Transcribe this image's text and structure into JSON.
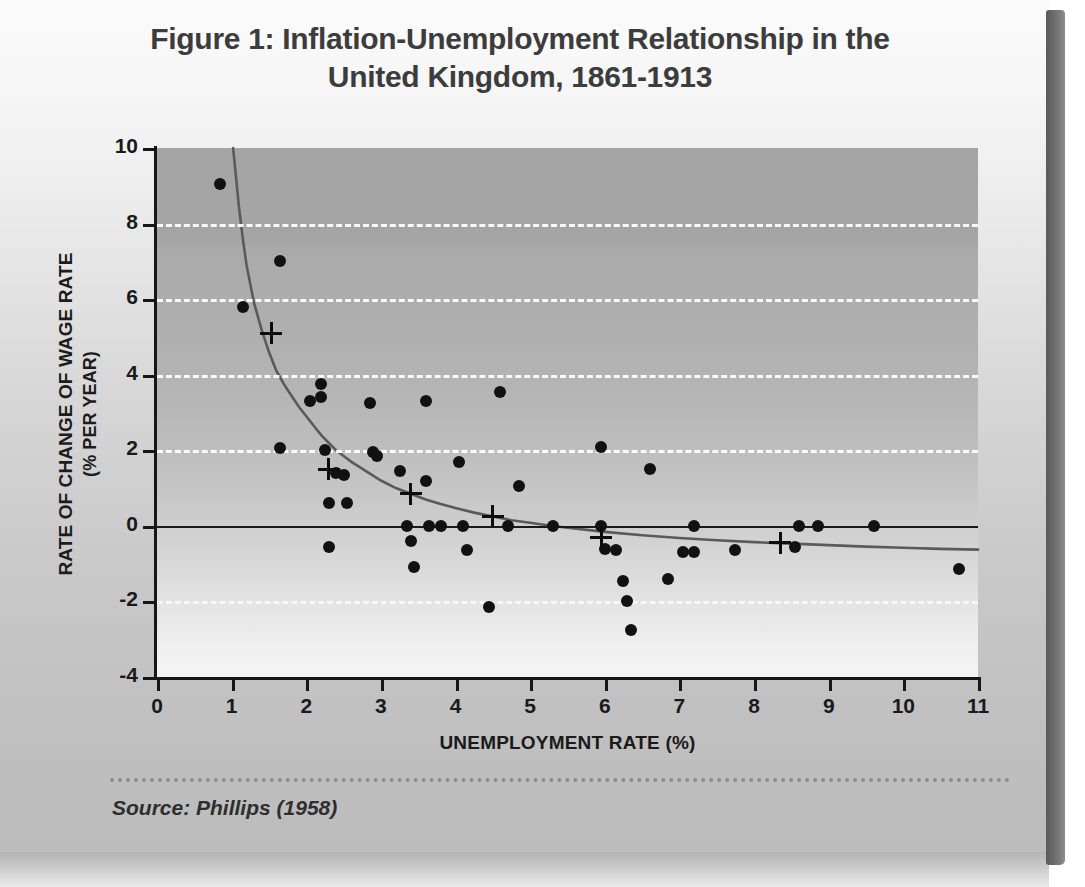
{
  "figure": {
    "title_line1": "Figure 1:  Inflation-Unemployment Relationship in the",
    "title_line2": "United Kingdom, 1861-1913",
    "source_note": "Source: Phillips (1958)"
  },
  "chart_data": {
    "type": "scatter",
    "title": "Figure 1:  Inflation-Unemployment Relationship in the United Kingdom, 1861-1913",
    "xlabel": "UNEMPLOYMENT RATE (%)",
    "ylabel": "RATE OF CHANGE OF WAGE RATE",
    "ylabel_sub": "(% PER YEAR)",
    "xlim": [
      0,
      11
    ],
    "ylim": [
      -4,
      10
    ],
    "xticks": [
      0,
      1,
      2,
      3,
      4,
      5,
      6,
      7,
      8,
      9,
      10,
      11
    ],
    "yticks": [
      -4,
      -2,
      0,
      2,
      4,
      6,
      8,
      10
    ],
    "xtick_labels": [
      "0",
      "1",
      "2",
      "3",
      "4",
      "5",
      "6",
      "7",
      "8",
      "9",
      "10",
      "11"
    ],
    "ytick_labels": [
      "-4",
      "-2",
      "0",
      "2",
      "4",
      "6",
      "8",
      "10"
    ],
    "grid": "horizontal dashed white at y = -2, 2, 4, 6, 8",
    "gridlines_y": [
      8,
      6,
      4,
      2,
      -2
    ],
    "zero_line_y": 0,
    "legend": null,
    "series": [
      {
        "name": "Annual observations (dots)",
        "marker": "circle",
        "color": "#111111",
        "points": [
          [
            0.85,
            9.05
          ],
          [
            1.15,
            5.8
          ],
          [
            1.65,
            7.0
          ],
          [
            1.65,
            2.05
          ],
          [
            2.05,
            3.3
          ],
          [
            2.2,
            3.4
          ],
          [
            2.2,
            3.75
          ],
          [
            2.25,
            2.0
          ],
          [
            2.3,
            0.6
          ],
          [
            2.3,
            -0.55
          ],
          [
            2.4,
            1.4
          ],
          [
            2.5,
            1.35
          ],
          [
            2.55,
            0.6
          ],
          [
            2.85,
            3.25
          ],
          [
            2.9,
            1.95
          ],
          [
            2.95,
            1.85
          ],
          [
            3.25,
            1.45
          ],
          [
            3.35,
            0.0
          ],
          [
            3.4,
            -0.4
          ],
          [
            3.45,
            -1.1
          ],
          [
            3.6,
            3.3
          ],
          [
            3.6,
            1.2
          ],
          [
            3.65,
            0.0
          ],
          [
            3.8,
            0.0
          ],
          [
            4.05,
            1.7
          ],
          [
            4.1,
            0.0
          ],
          [
            4.15,
            -0.65
          ],
          [
            4.45,
            -2.15
          ],
          [
            4.6,
            3.55
          ],
          [
            4.7,
            0.0
          ],
          [
            4.85,
            1.05
          ],
          [
            5.3,
            0.0
          ],
          [
            5.95,
            2.1
          ],
          [
            5.95,
            0.0
          ],
          [
            6.0,
            -0.6
          ],
          [
            6.15,
            -0.65
          ],
          [
            6.25,
            -1.45
          ],
          [
            6.3,
            -2.0
          ],
          [
            6.35,
            -2.75
          ],
          [
            6.6,
            1.5
          ],
          [
            6.85,
            -1.4
          ],
          [
            7.05,
            -0.7
          ],
          [
            7.2,
            -0.7
          ],
          [
            7.2,
            0.0
          ],
          [
            7.75,
            -0.65
          ],
          [
            8.55,
            -0.55
          ],
          [
            8.6,
            0.0
          ],
          [
            8.85,
            0.0
          ],
          [
            9.6,
            0.0
          ],
          [
            10.75,
            -1.15
          ]
        ]
      },
      {
        "name": "Group means (crosses)",
        "marker": "plus",
        "color": "#0d0d0d",
        "points": [
          [
            1.53,
            5.1
          ],
          [
            2.3,
            1.5
          ],
          [
            3.4,
            0.85
          ],
          [
            4.5,
            0.25
          ],
          [
            5.95,
            -0.3
          ],
          [
            8.35,
            -0.45
          ]
        ]
      }
    ],
    "fitted_curve": {
      "name": "Fitted Phillips curve",
      "color": "#5a5a5a",
      "points": [
        [
          1.02,
          10.0
        ],
        [
          1.05,
          9.4
        ],
        [
          1.1,
          8.4
        ],
        [
          1.15,
          7.6
        ],
        [
          1.2,
          6.9
        ],
        [
          1.3,
          5.9
        ],
        [
          1.4,
          5.2
        ],
        [
          1.5,
          4.6
        ],
        [
          1.6,
          4.1
        ],
        [
          1.7,
          3.75
        ],
        [
          1.8,
          3.45
        ],
        [
          1.9,
          3.15
        ],
        [
          2.0,
          2.9
        ],
        [
          2.1,
          2.65
        ],
        [
          2.2,
          2.4
        ],
        [
          2.3,
          2.2
        ],
        [
          2.4,
          2.0
        ],
        [
          2.5,
          1.85
        ],
        [
          2.6,
          1.7
        ],
        [
          2.8,
          1.45
        ],
        [
          3.0,
          1.2
        ],
        [
          3.2,
          1.0
        ],
        [
          3.4,
          0.85
        ],
        [
          3.6,
          0.7
        ],
        [
          3.8,
          0.58
        ],
        [
          4.0,
          0.47
        ],
        [
          4.25,
          0.35
        ],
        [
          4.5,
          0.25
        ],
        [
          4.75,
          0.15
        ],
        [
          5.0,
          0.08
        ],
        [
          5.25,
          0.01
        ],
        [
          5.5,
          -0.05
        ],
        [
          6.0,
          -0.16
        ],
        [
          6.5,
          -0.25
        ],
        [
          7.0,
          -0.32
        ],
        [
          7.5,
          -0.38
        ],
        [
          8.0,
          -0.43
        ],
        [
          8.5,
          -0.47
        ],
        [
          9.0,
          -0.51
        ],
        [
          9.5,
          -0.55
        ],
        [
          10.0,
          -0.58
        ],
        [
          10.5,
          -0.61
        ],
        [
          11.0,
          -0.63
        ]
      ]
    }
  },
  "colors": {
    "marker": "#111111",
    "curve": "#5a5a5a",
    "zero_line": "#1a1a1a",
    "gridline": "#ffffff",
    "axis": "#161616",
    "title_text": "#3c3c3c"
  }
}
